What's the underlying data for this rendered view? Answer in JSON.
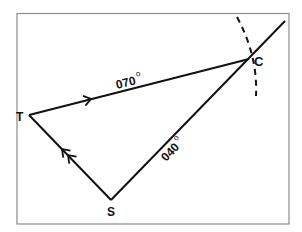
{
  "diagram": {
    "type": "navigation-vector-triangle",
    "frame": {
      "stroke": "#8a8a8a"
    },
    "points": {
      "T": {
        "label": "T"
      },
      "C": {
        "label": "C"
      },
      "S": {
        "label": "S"
      }
    },
    "edges": [
      {
        "from": "T",
        "to": "C",
        "bearing": "070",
        "degree_symbol": "o",
        "arrows": 1
      },
      {
        "from": "S",
        "to": "C",
        "bearing": "040",
        "degree_symbol": "o",
        "arrows": 0,
        "extends_beyond": true
      },
      {
        "from": "S",
        "to": "T",
        "arrows": 2
      }
    ],
    "arc": {
      "style": "dashed",
      "center_point": "T",
      "passes_through": "C"
    },
    "colors": {
      "line": "#111111",
      "frame": "#8a8a8a",
      "background": "#ffffff"
    }
  }
}
